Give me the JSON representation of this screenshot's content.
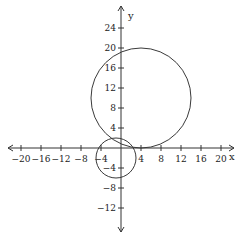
{
  "chart_data": {
    "type": "scatter",
    "title": "",
    "xlabel": "x",
    "ylabel": "y",
    "xlim": [
      -22,
      22
    ],
    "ylim": [
      -17,
      28
    ],
    "grid": false,
    "x_ticks": [
      -20,
      -16,
      -12,
      -8,
      -4,
      4,
      8,
      12,
      16,
      20
    ],
    "x_tick_labels": [
      "−20",
      "−16",
      "−12",
      "−8",
      "−4",
      "4",
      "8",
      "12",
      "16",
      "20"
    ],
    "y_ticks": [
      24,
      20,
      16,
      12,
      8,
      4,
      -4,
      -8,
      -12
    ],
    "y_tick_labels": [
      "24",
      "20",
      "16",
      "12",
      "8",
      "4",
      "−4",
      "−8",
      "−12"
    ],
    "series": [
      {
        "name": "large circle",
        "shape": "circle",
        "center": [
          4,
          10
        ],
        "radius": 10
      },
      {
        "name": "small circle",
        "shape": "circle",
        "center": [
          -1,
          -2
        ],
        "radius": 4
      }
    ],
    "legend": null
  },
  "axes": {
    "x_label": "x",
    "y_label": "y"
  },
  "layout": {
    "origin_px": [
      121,
      148
    ],
    "px_per_unit": 5
  }
}
